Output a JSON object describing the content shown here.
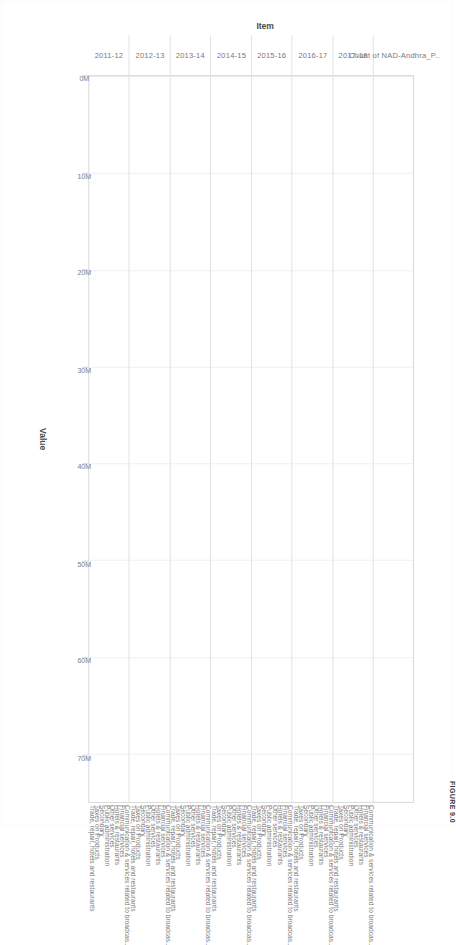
{
  "figure": {
    "measure_title": "Count of NAD-Andhra_P..",
    "caption": "FIGURE 9.0"
  },
  "axes": {
    "item_axis_title": "Item",
    "value_axis_title": "Value",
    "value_ticks": [
      "0M",
      "10M",
      "20M",
      "30M",
      "40M",
      "50M",
      "60M",
      "70M"
    ]
  },
  "chart_data": {
    "type": "bar",
    "title": "Count of NAD-Andhra_P..",
    "xlabel": "Value",
    "ylabel": "Item",
    "orientation": "horizontal",
    "grid": true,
    "legend": "none",
    "xlim": [
      0,
      75000000
    ],
    "tick_labels": [
      "0M",
      "10M",
      "20M",
      "30M",
      "40M",
      "50M",
      "60M",
      "70M"
    ],
    "tick_values": [
      0,
      10000000,
      20000000,
      30000000,
      40000000,
      50000000,
      60000000,
      70000000
    ],
    "groups": [
      "2011-12",
      "2012-13",
      "2013-14",
      "2014-15",
      "2015-16",
      "2016-17",
      "2017-18"
    ],
    "categories": [
      "Communication & services related to broadcas..",
      "Financial services",
      "Hotels & restaurants",
      "Other services",
      "Public administration",
      "Secondary",
      "Taxes on Products",
      "Trade, repair, hotels and restaurants"
    ],
    "series": [
      {
        "name": "2011-12",
        "values": [
          5200000,
          1800000,
          37000000,
          6500000,
          8500000,
          2400000,
          25500000,
          4200000
        ]
      },
      {
        "name": "2012-13",
        "values": [
          6000000,
          2000000,
          40000000,
          7200000,
          9800000,
          2700000,
          29500000,
          4800000
        ]
      },
      {
        "name": "2013-14",
        "values": [
          6800000,
          2200000,
          44000000,
          8200000,
          11000000,
          3000000,
          34000000,
          5400000
        ]
      },
      {
        "name": "2014-15",
        "values": [
          7600000,
          2500000,
          49000000,
          9200000,
          12500000,
          3400000,
          38500000,
          6000000
        ]
      },
      {
        "name": "2015-16",
        "values": [
          8400000,
          2800000,
          54000000,
          10200000,
          14000000,
          3800000,
          43500000,
          6800000
        ]
      },
      {
        "name": "2016-17",
        "values": [
          9200000,
          3000000,
          59000000,
          11200000,
          15500000,
          4200000,
          49000000,
          7400000
        ]
      },
      {
        "name": "2017-18",
        "values": [
          10000000,
          3300000,
          63000000,
          12000000,
          17000000,
          4600000,
          54000000,
          8000000
        ]
      }
    ]
  }
}
